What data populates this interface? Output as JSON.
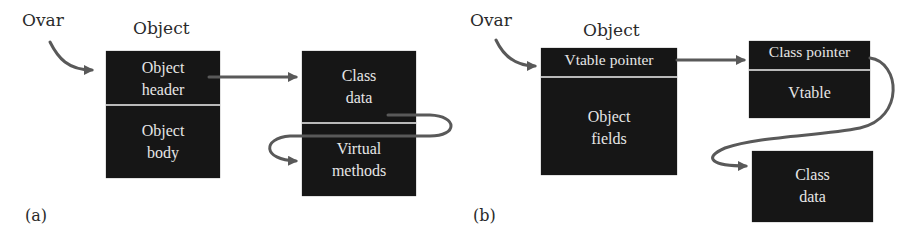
{
  "diagram": {
    "panel_a": {
      "caption": "(a)",
      "variable_label": "Ovar",
      "object_label": "Object",
      "object_box": {
        "top_cell": [
          "Object",
          "header"
        ],
        "bottom_cell": [
          "Object",
          "body"
        ]
      },
      "class_box": {
        "top_cell": [
          "Class",
          "data"
        ],
        "bottom_cell": [
          "Virtual",
          "methods"
        ]
      },
      "edges": [
        {
          "from": "Ovar",
          "to": "Object header"
        },
        {
          "from": "Object header",
          "to": "Class data"
        },
        {
          "from": "Class data",
          "to": "Virtual methods"
        }
      ]
    },
    "panel_b": {
      "caption": "(b)",
      "variable_label": "Ovar",
      "object_label": "Object",
      "object_box": {
        "top_cell": [
          "Vtable pointer"
        ],
        "bottom_cell": [
          "Object",
          "fields"
        ]
      },
      "vtable_box": {
        "top_cell": [
          "Class pointer"
        ],
        "bottom_cell": [
          "Vtable"
        ]
      },
      "class_data_box": {
        "cell": [
          "Class",
          "data"
        ]
      },
      "edges": [
        {
          "from": "Ovar",
          "to": "Vtable pointer"
        },
        {
          "from": "Vtable pointer",
          "to": "Class pointer"
        },
        {
          "from": "Class pointer",
          "to": "Class data"
        }
      ]
    },
    "colors": {
      "box_fill": "#161616",
      "box_text": "#e6e6e6",
      "separator": "#b9b9b9",
      "arrow": "#595959",
      "label_text": "#2a2a2a",
      "background": "#ffffff"
    }
  }
}
